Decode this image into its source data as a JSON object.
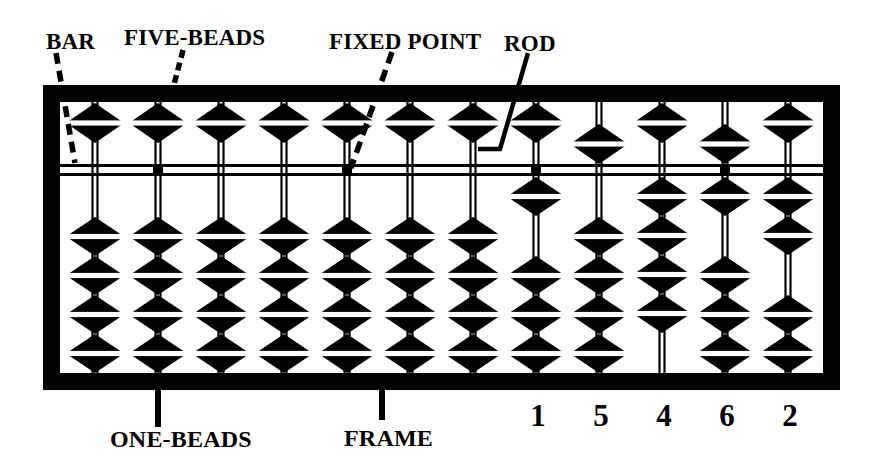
{
  "labels": {
    "bar": "BAR",
    "five_beads": "FIVE-BEADS",
    "fixed_point": "FIXED POINT",
    "rod": "ROD",
    "one_beads": "ONE-BEADS",
    "frame": "FRAME"
  },
  "abacus": {
    "rod_count": 12,
    "five_beads_per_rod": 1,
    "one_beads_per_rod": 4,
    "displayed_number": "15462",
    "unit_dot_rods": [
      2,
      5,
      8,
      11
    ],
    "rods": [
      {
        "position": 1,
        "value": 0,
        "five_bead_down": false,
        "one_beads_up": 0,
        "digit": ""
      },
      {
        "position": 2,
        "value": 0,
        "five_bead_down": false,
        "one_beads_up": 0,
        "digit": ""
      },
      {
        "position": 3,
        "value": 0,
        "five_bead_down": false,
        "one_beads_up": 0,
        "digit": ""
      },
      {
        "position": 4,
        "value": 0,
        "five_bead_down": false,
        "one_beads_up": 0,
        "digit": ""
      },
      {
        "position": 5,
        "value": 0,
        "five_bead_down": false,
        "one_beads_up": 0,
        "digit": ""
      },
      {
        "position": 6,
        "value": 0,
        "five_bead_down": false,
        "one_beads_up": 0,
        "digit": ""
      },
      {
        "position": 7,
        "value": 0,
        "five_bead_down": false,
        "one_beads_up": 0,
        "digit": ""
      },
      {
        "position": 8,
        "value": 1,
        "five_bead_down": false,
        "one_beads_up": 1,
        "digit": "1"
      },
      {
        "position": 9,
        "value": 5,
        "five_bead_down": true,
        "one_beads_up": 0,
        "digit": "5"
      },
      {
        "position": 10,
        "value": 4,
        "five_bead_down": false,
        "one_beads_up": 4,
        "digit": "4"
      },
      {
        "position": 11,
        "value": 6,
        "five_bead_down": true,
        "one_beads_up": 1,
        "digit": "6"
      },
      {
        "position": 12,
        "value": 2,
        "five_bead_down": false,
        "one_beads_up": 2,
        "digit": "2"
      }
    ]
  },
  "colors": {
    "ink": "#000000",
    "paper": "#ffffff"
  }
}
